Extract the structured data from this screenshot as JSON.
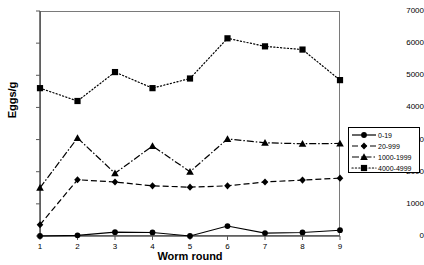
{
  "chart_data": {
    "type": "line",
    "title": "",
    "xlabel": "Worm round",
    "ylabel": "Eggs/g",
    "x": [
      1,
      2,
      3,
      4,
      5,
      6,
      7,
      8,
      9
    ],
    "xlim": [
      1,
      9
    ],
    "ylim": [
      0,
      7000
    ],
    "ytick_labels": [
      "0",
      "1000",
      "2000",
      "3000",
      "4000",
      "5000",
      "6000",
      "7000"
    ],
    "yticks": [
      0,
      1000,
      2000,
      3000,
      4000,
      5000,
      6000,
      7000
    ],
    "xtick_labels": [
      "1",
      "2",
      "3",
      "4",
      "5",
      "6",
      "7",
      "8",
      "9"
    ],
    "grid": false,
    "legend_position": "right",
    "series": [
      {
        "name": "0-19",
        "marker": "circle",
        "line_style": "solid",
        "color": "#000000",
        "values": [
          0,
          20,
          120,
          110,
          0,
          310,
          90,
          110,
          180
        ]
      },
      {
        "name": "20-999",
        "marker": "diamond",
        "line_style": "dashed",
        "color": "#000000",
        "values": [
          350,
          1750,
          1680,
          1560,
          1520,
          1560,
          1680,
          1740,
          1800
        ]
      },
      {
        "name": "1000-1999",
        "marker": "triangle",
        "line_style": "dashdot",
        "color": "#000000",
        "values": [
          1500,
          3050,
          1950,
          2800,
          2000,
          3020,
          2900,
          2870,
          2880
        ]
      },
      {
        "name": "4000-4999",
        "marker": "square",
        "line_style": "dotted",
        "color": "#000000",
        "values": [
          4600,
          4200,
          5100,
          4600,
          4900,
          6150,
          5900,
          5800,
          4850
        ]
      }
    ]
  },
  "legend": {
    "entries": [
      {
        "label": "0-19"
      },
      {
        "label": "20-999"
      },
      {
        "label": "1000-1999"
      },
      {
        "label": "4000-4999"
      }
    ]
  }
}
